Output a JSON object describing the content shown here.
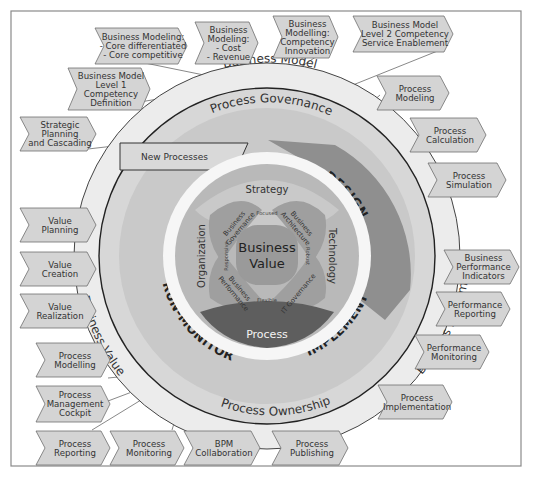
{
  "diagram": {
    "center_label_line1": "Business",
    "center_label_line2": "Value",
    "rings": {
      "outer": {
        "business_model": "Business Model",
        "business_value": "Business Value",
        "business_performance": "Business Performance"
      },
      "governance": {
        "process_governance": "Process Governance",
        "process_ownership": "Process Ownership"
      },
      "lifecycle_phases": [
        "ANALYZE",
        "DESIGN",
        "IMPLEMENT",
        "RUN-MONITOR"
      ],
      "new_processes": "New Processes"
    },
    "inner": {
      "strategy": "Strategy",
      "technology": "Technology",
      "process": "Process",
      "organization": "Organization",
      "business_governance": [
        "Business",
        "Governance"
      ],
      "business_architecture": [
        "Business",
        "Architecture"
      ],
      "it_governance": "IT Governance",
      "business_performance": [
        "Business",
        "Performance"
      ],
      "qualities": {
        "focused": "Focused",
        "robust": "Robust",
        "flexible": "Flexible",
        "responsive": "Responsive"
      }
    },
    "chevrons": {
      "top": [
        {
          "id": "bm-core",
          "lines": [
            "Business Modeling:",
            "- Core differentiated",
            "- Core competitive"
          ]
        },
        {
          "id": "bm-cost",
          "lines": [
            "Business",
            "Modeling:",
            "- Cost",
            "- Revenue"
          ]
        },
        {
          "id": "bm-competency",
          "lines": [
            "Business",
            "Modelling:",
            "Competency",
            "Innovation"
          ]
        },
        {
          "id": "bm-level2",
          "lines": [
            "Business Model",
            "Level 2 Competency",
            "Service Enablement"
          ]
        },
        {
          "id": "bm-level1",
          "lines": [
            "Business Model",
            "Level 1",
            "Competency",
            "Definition"
          ]
        },
        {
          "id": "strategic",
          "lines": [
            "Strategic",
            "Planning",
            "and Cascading"
          ]
        }
      ],
      "right": [
        {
          "id": "proc-modeling",
          "lines": [
            "Process",
            "Modeling"
          ]
        },
        {
          "id": "proc-calculation",
          "lines": [
            "Process",
            "Calculation"
          ]
        },
        {
          "id": "proc-simulation",
          "lines": [
            "Process",
            "Simulation"
          ]
        },
        {
          "id": "bpi",
          "lines": [
            "Business",
            "Performance",
            "Indicators"
          ]
        },
        {
          "id": "perf-reporting",
          "lines": [
            "Performance",
            "Reporting"
          ]
        },
        {
          "id": "perf-monitoring",
          "lines": [
            "Performance",
            "Monitoring"
          ]
        },
        {
          "id": "proc-implementation",
          "lines": [
            "Process",
            "Implementation"
          ]
        }
      ],
      "left": [
        {
          "id": "value-planning",
          "lines": [
            "Value",
            "Planning"
          ]
        },
        {
          "id": "value-creation",
          "lines": [
            "Value",
            "Creation"
          ]
        },
        {
          "id": "value-realization",
          "lines": [
            "Value",
            "Realization"
          ]
        },
        {
          "id": "proc-modelling",
          "lines": [
            "Process",
            "Modelling"
          ]
        },
        {
          "id": "proc-cockpit",
          "lines": [
            "Process",
            "Management",
            "Cockpit"
          ]
        }
      ],
      "bottom": [
        {
          "id": "proc-reporting",
          "lines": [
            "Process",
            "Reporting"
          ]
        },
        {
          "id": "proc-monitoring",
          "lines": [
            "Process",
            "Monitoring"
          ]
        },
        {
          "id": "bpm-collab",
          "lines": [
            "BPM",
            "Collaboration"
          ]
        },
        {
          "id": "proc-publishing",
          "lines": [
            "Process",
            "Publishing"
          ]
        }
      ]
    },
    "colors": {
      "chevron_fill": "#d4d4d4",
      "outer_ring": "#ececec",
      "governance_ring": "#d7d7d7",
      "design_band": "#8f8f8f",
      "process_petal": "#5e5e5e",
      "center": "#9a9a9a"
    }
  }
}
